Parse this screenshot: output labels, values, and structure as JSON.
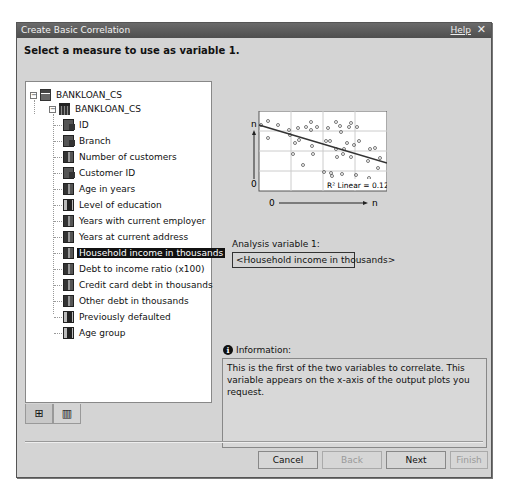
{
  "dialog": {
    "title": "Create Basic Correlation",
    "help_label": "Help",
    "close_glyph": "✕",
    "heading": "Select a measure to use as variable 1."
  },
  "tree": {
    "root": {
      "label": "BANKLOAN_CS",
      "icon": "database-icon",
      "expanded": true
    },
    "table": {
      "label": "BANKLOAN_CS",
      "icon": "table-icon",
      "expanded": true
    },
    "items": [
      {
        "label": "ID",
        "icon": "character-variable-icon"
      },
      {
        "label": "Branch",
        "icon": "character-variable-icon"
      },
      {
        "label": "Number of customers",
        "icon": "numeric-variable-icon"
      },
      {
        "label": "Customer ID",
        "icon": "character-variable-icon"
      },
      {
        "label": "Age in years",
        "icon": "numeric-variable-icon"
      },
      {
        "label": "Level of education",
        "icon": "category-variable-icon"
      },
      {
        "label": "Years with current employer",
        "icon": "numeric-variable-icon"
      },
      {
        "label": "Years at current address",
        "icon": "numeric-variable-icon"
      },
      {
        "label": "Household income in thousands",
        "icon": "numeric-variable-icon",
        "selected": true
      },
      {
        "label": "Debt to income ratio (x100)",
        "icon": "numeric-variable-icon"
      },
      {
        "label": "Credit card debt in thousands",
        "icon": "numeric-variable-icon"
      },
      {
        "label": "Other debt in thousands",
        "icon": "numeric-variable-icon"
      },
      {
        "label": "Previously defaulted",
        "icon": "category-variable-icon"
      },
      {
        "label": "Age group",
        "icon": "category-variable-icon"
      }
    ]
  },
  "tabs": [
    {
      "name": "hierarchy-view-tab",
      "glyph": "⊞",
      "icon": "hierarchy-icon"
    },
    {
      "name": "table-view-tab",
      "glyph": "▥",
      "icon": "table-view-icon",
      "active": true
    }
  ],
  "preview": {
    "y_top_label": "n",
    "y_bottom_label": "0",
    "x_left_label": "0",
    "x_right_label": "n",
    "r2_text": "R² Linear = 0.123"
  },
  "analysis": {
    "label": "Analysis variable 1:",
    "value": "<Household income in thousands>"
  },
  "info": {
    "heading": "Information:",
    "text": "This is the first of the two variables to correlate. This variable appears on the x-axis of the output plots you request."
  },
  "buttons": {
    "cancel": "Cancel",
    "back": "Back",
    "next": "Next",
    "finish": "Finish"
  }
}
